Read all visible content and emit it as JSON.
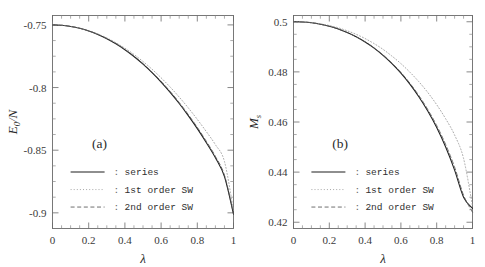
{
  "figure": {
    "width": 485,
    "height": 267,
    "background": "#ffffff",
    "series_color": "#1e1e1e",
    "sw1_color": "#9a9a9a",
    "sw2_color": "#555555",
    "axis_color": "#6a6a6a"
  },
  "legend_common": {
    "separator": ":",
    "entries": [
      {
        "label": "series",
        "style": "solid"
      },
      {
        "label": "1st order SW",
        "style": "dotted"
      },
      {
        "label": "2nd order SW",
        "style": "dashed"
      }
    ]
  },
  "chart_data": [
    {
      "type": "line",
      "panel": "(a)",
      "title": "",
      "xlabel": "λ",
      "ylabel": "E",
      "ylabel_sub": "0",
      "ylabel_tail": "/N",
      "xlim": [
        0,
        1
      ],
      "ylim": [
        -0.9125,
        -0.7425
      ],
      "grid": false,
      "legend_position": "center-left",
      "xticks": [
        0,
        0.2,
        0.4,
        0.6,
        0.8,
        1
      ],
      "xticklabels": [
        "0",
        "0.2",
        "0.4",
        "0.6",
        "0.8",
        "1"
      ],
      "yticks": [
        -0.75,
        -0.8,
        -0.85,
        -0.9
      ],
      "yticklabels": [
        "-0.75",
        "-0.8",
        "-0.85",
        "-0.9"
      ],
      "minor_per_major_x": 4,
      "minor_per_major_y": 4,
      "x": [
        0,
        0.05,
        0.1,
        0.15,
        0.2,
        0.25,
        0.3,
        0.35,
        0.4,
        0.45,
        0.5,
        0.55,
        0.6,
        0.65,
        0.7,
        0.75,
        0.8,
        0.85,
        0.9,
        0.95,
        1
      ],
      "series": [
        {
          "name": "series",
          "style": "solid",
          "values": [
            -0.75,
            -0.7503,
            -0.7512,
            -0.7527,
            -0.7548,
            -0.7576,
            -0.761,
            -0.7651,
            -0.7698,
            -0.7752,
            -0.7813,
            -0.7881,
            -0.7956,
            -0.8038,
            -0.8127,
            -0.8224,
            -0.8328,
            -0.844,
            -0.856,
            -0.871,
            -0.901
          ]
        },
        {
          "name": "1st order SW",
          "style": "dotted",
          "values": [
            -0.75,
            -0.7503,
            -0.7512,
            -0.7526,
            -0.7546,
            -0.7572,
            -0.7604,
            -0.7642,
            -0.7686,
            -0.7736,
            -0.7792,
            -0.7854,
            -0.7922,
            -0.7996,
            -0.8076,
            -0.8162,
            -0.8254,
            -0.8352,
            -0.8456,
            -0.859,
            -0.898
          ]
        },
        {
          "name": "2nd order SW",
          "style": "dashed",
          "values": [
            -0.75,
            -0.7503,
            -0.7512,
            -0.7527,
            -0.7548,
            -0.7575,
            -0.7609,
            -0.7649,
            -0.7696,
            -0.7749,
            -0.7809,
            -0.7876,
            -0.795,
            -0.8031,
            -0.8119,
            -0.8215,
            -0.8318,
            -0.8429,
            -0.8549,
            -0.87,
            -0.9005
          ]
        }
      ]
    },
    {
      "type": "line",
      "panel": "(b)",
      "title": "",
      "xlabel": "λ",
      "ylabel": "M",
      "ylabel_sub": "s",
      "ylabel_tail": "",
      "xlim": [
        0,
        1
      ],
      "ylim": [
        0.4175,
        0.5025
      ],
      "grid": false,
      "legend_position": "center-left",
      "xticks": [
        0,
        0.2,
        0.4,
        0.6,
        0.8,
        1
      ],
      "xticklabels": [
        "0",
        "0.2",
        "0.4",
        "0.6",
        "0.8",
        "1"
      ],
      "yticks": [
        0.5,
        0.48,
        0.46,
        0.44,
        0.42
      ],
      "yticklabels": [
        "0.5",
        "0.48",
        "0.46",
        "0.44",
        "0.42"
      ],
      "minor_per_major_x": 4,
      "minor_per_major_y": 4,
      "x": [
        0,
        0.05,
        0.1,
        0.15,
        0.2,
        0.25,
        0.3,
        0.35,
        0.4,
        0.45,
        0.5,
        0.55,
        0.6,
        0.65,
        0.7,
        0.75,
        0.8,
        0.85,
        0.9,
        0.95,
        1
      ],
      "series": [
        {
          "name": "series",
          "style": "solid",
          "values": [
            0.5,
            0.4999,
            0.4996,
            0.499,
            0.4982,
            0.4971,
            0.4957,
            0.494,
            0.4919,
            0.4895,
            0.4866,
            0.4833,
            0.4795,
            0.4751,
            0.4701,
            0.4644,
            0.4578,
            0.45,
            0.4408,
            0.43,
            0.4255
          ]
        },
        {
          "name": "1st order SW",
          "style": "dotted",
          "values": [
            0.5,
            0.4999,
            0.4997,
            0.4992,
            0.4985,
            0.4976,
            0.4964,
            0.495,
            0.4933,
            0.4913,
            0.489,
            0.4863,
            0.4833,
            0.4799,
            0.4761,
            0.4718,
            0.4669,
            0.4613,
            0.4548,
            0.4455,
            0.4265
          ]
        },
        {
          "name": "2nd order SW",
          "style": "dashed",
          "values": [
            0.5,
            0.4999,
            0.4996,
            0.499,
            0.4982,
            0.4971,
            0.4957,
            0.494,
            0.492,
            0.4896,
            0.4868,
            0.4835,
            0.4798,
            0.4755,
            0.4706,
            0.465,
            0.4586,
            0.451,
            0.442,
            0.4308,
            0.424
          ]
        }
      ]
    }
  ]
}
